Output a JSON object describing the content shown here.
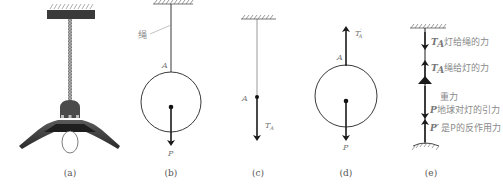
{
  "figure": {
    "panels": [
      {
        "id": "a",
        "caption": "(a)",
        "description": "hanging lamp"
      },
      {
        "id": "b",
        "caption": "(b)",
        "rope_label": "绳",
        "point_label": "A",
        "force_label": "P"
      },
      {
        "id": "c",
        "caption": "(c)",
        "point_label": "A",
        "force_label": "T",
        "force_subscript": "A"
      },
      {
        "id": "d",
        "caption": "(d)",
        "point_label": "A",
        "force_up_label": "T",
        "force_up_prime": "′",
        "force_up_subscript": "A",
        "force_down_label": "P"
      },
      {
        "id": "e",
        "caption": "(e)",
        "annotations": [
          {
            "symbol": "T",
            "sub": "A",
            "text": "灯给绳的力"
          },
          {
            "symbol": "T",
            "sub": "A",
            "prime": "′",
            "text": "绳给灯的力"
          },
          {
            "symbol": "",
            "sub": "",
            "text": "重力"
          },
          {
            "symbol": "P",
            "sub": "",
            "text": "地球对灯的引力"
          },
          {
            "symbol": "P′",
            "sub": "",
            "text": "是P的反作用力"
          }
        ]
      }
    ]
  },
  "colors": {
    "line": "#222222",
    "label": "#777777",
    "lamp_dark": "#3a3a3a",
    "lamp_body": "#555555",
    "chain": "#9a9a9a"
  }
}
